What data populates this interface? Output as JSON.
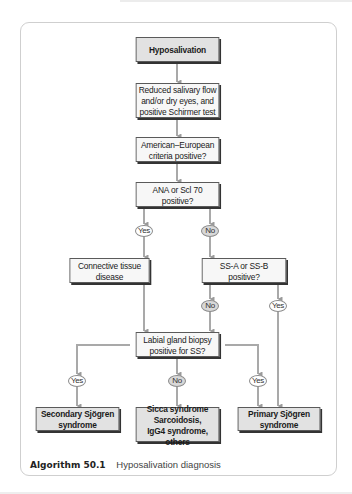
{
  "figure": {
    "caption_label": "Algorithm 50.1",
    "caption_text": "Hyposalivation diagnosis"
  },
  "nodes": {
    "start": "Hyposalivation",
    "reduced_flow": "Reduced salivary flow and/or dry eyes, and positive Schirmer test",
    "criteria": "American–European criteria positive?",
    "ana": "ANA or Scl 70 positive?",
    "connective": "Connective tissue disease",
    "ssa": "SS-A or SS-B positive?",
    "biopsy": "Labial gland biopsy positive for SS?",
    "secondary": "Secondary Sjögren syndrome",
    "sicca": "Sicca syndrome Sarcoidosis, IgG4 syndrome, others",
    "primary": "Primary Sjögren syndrome"
  },
  "node_lines": {
    "reduced_flow": [
      "Reduced salivary flow",
      "and/or dry eyes, and",
      "positive Schirmer test"
    ],
    "criteria": [
      "American–European",
      "criteria positive?"
    ],
    "ana": [
      "ANA or Scl 70",
      "positive?"
    ],
    "connective": [
      "Connective tissue",
      "disease"
    ],
    "ssa": [
      "SS-A or SS-B",
      "positive?"
    ],
    "biopsy": [
      "Labial gland biopsy",
      "positive for SS?"
    ],
    "secondary": [
      "Secondary Sjögren",
      "syndrome"
    ],
    "sicca": [
      "Sicca syndrome",
      "Sarcoidosis,",
      "IgG4 syndrome, others"
    ],
    "primary": [
      "Primary Sjögren",
      "syndrome"
    ]
  },
  "labels": {
    "ana_yes": "Yes",
    "ana_no": "No",
    "ssa_no": "No",
    "ssa_yes": "Yes",
    "biopsy_yes_secondary": "Yes",
    "biopsy_no": "No",
    "biopsy_yes_primary": "Yes"
  },
  "colors": {
    "connector": "#a9a9a9",
    "box_light": "#f7f7f7",
    "box_dark": "#e2e2e2",
    "oval_no": "#d8d8d8"
  }
}
